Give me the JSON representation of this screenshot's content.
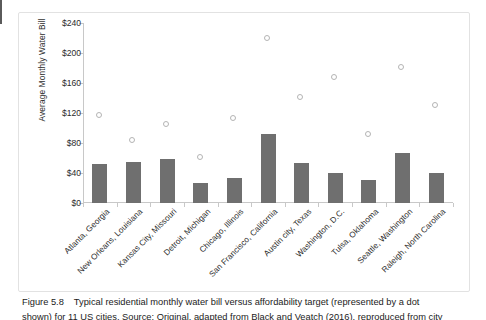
{
  "figure": {
    "caption_number": "Figure 5.8",
    "caption_text": "Typical residential monthly water bill versus affordability target (represented by a dot",
    "caption_text_line2": "shown) for 11 US cities. Source: Original, adapted from Black and Veatch (2016), reproduced from city"
  },
  "chart_data": {
    "type": "bar",
    "title": "",
    "xlabel": "",
    "ylabel": "Average Monthly Water Bill",
    "ylim": [
      0,
      240
    ],
    "ytick_labels": [
      "$0",
      "$40",
      "$80",
      "$120",
      "$160",
      "$200",
      "$240"
    ],
    "ytick_values": [
      0,
      40,
      80,
      120,
      160,
      200,
      240
    ],
    "grid": false,
    "legend": "none",
    "categories": [
      "Atlanta, Georgia",
      "New Orleans, Louisiana",
      "Kansas City, Missouri",
      "Detroit, Michigan",
      "Chicago, Illinois",
      "San Francisco, California",
      "Austin city, Texas",
      "Washington, D.C.",
      "Tulsa, Oklahoma",
      "Seattle, Washington",
      "Raleigh, North Carolina"
    ],
    "series": [
      {
        "name": "Average Monthly Water Bill",
        "mark": "bar",
        "color": "#6f6f6f",
        "values": [
          52,
          55,
          59,
          27,
          34,
          92,
          53,
          40,
          31,
          67,
          40
        ]
      },
      {
        "name": "Affordability target",
        "mark": "dot",
        "color": "#b4b4b4",
        "values": [
          116,
          82,
          104,
          60,
          112,
          219,
          140,
          167,
          91,
          180,
          129
        ]
      }
    ]
  }
}
